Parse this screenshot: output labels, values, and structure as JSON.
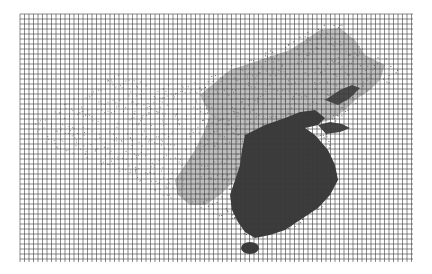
{
  "map": {
    "title": "",
    "description": "Dot-density map of China with a square grid overlay",
    "grid": {
      "x0": 20,
      "y0": 14,
      "x1": 413,
      "y1": 262,
      "dx": 4.5,
      "dy": 5.0,
      "color": "#3a3a3a"
    },
    "colors": {
      "background": "#ffffff",
      "dense": "#3c3c3c",
      "medium": "#6a6a6a",
      "sparse": "#9a9a9a"
    },
    "regions": [
      {
        "name": "eastern-core",
        "density": "dense"
      },
      {
        "name": "northeast",
        "density": "medium"
      },
      {
        "name": "north-central",
        "density": "medium"
      },
      {
        "name": "west",
        "density": "sparse"
      },
      {
        "name": "hainan-island",
        "density": "dense"
      }
    ]
  }
}
